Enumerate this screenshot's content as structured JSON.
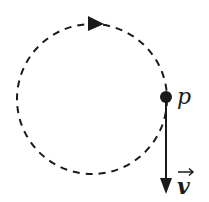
{
  "diagram": {
    "type": "circular-motion",
    "path_style": "dashed",
    "direction": "clockwise",
    "point": {
      "label": "p"
    },
    "velocity": {
      "label": "v",
      "has_vector_arrow": true,
      "direction": "down"
    },
    "colors": {
      "ink": "#1a1a1a",
      "background": "#ffffff"
    }
  }
}
